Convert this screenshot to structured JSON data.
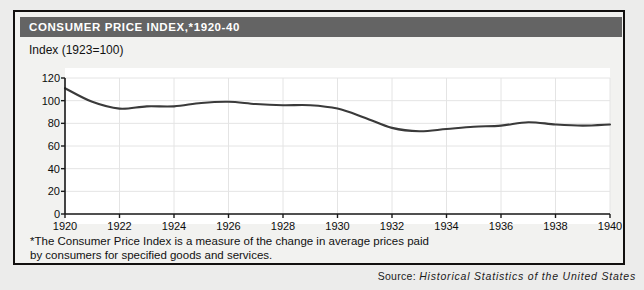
{
  "card": {
    "title": "CONSUMER PRICE INDEX,*1920-40",
    "subtitle": "Index (1923=100)",
    "footnote_line1": "*The Consumer Price Index is a measure of the change in average prices paid",
    "footnote_line2": "by consumers for specified goods and services."
  },
  "source": {
    "label": "Source:",
    "title": "Historical Statistics of the United States"
  },
  "colors": {
    "title_bar": "#646464",
    "title_text": "#ffffff",
    "card_background": "#f2f2f0",
    "page_background": "#ececeb",
    "plot_background": "#ffffff",
    "line": "#3a3a3a",
    "axis": "#1a1a1a",
    "grid": "#e4e4e4"
  },
  "chart_data": {
    "type": "line",
    "title": "CONSUMER PRICE INDEX,*1920-40",
    "subtitle": "Index (1923=100)",
    "xlabel": "",
    "ylabel": "Index (1923=100)",
    "xlim": [
      1920,
      1940
    ],
    "ylim": [
      0,
      120
    ],
    "yticks": [
      0,
      20,
      40,
      60,
      80,
      100,
      120
    ],
    "ytick_labels": [
      "0",
      "20",
      "40",
      "60",
      "80",
      "100",
      "120"
    ],
    "xticks": [
      1920,
      1922,
      1924,
      1926,
      1928,
      1930,
      1932,
      1934,
      1936,
      1938,
      1940
    ],
    "xtick_labels": [
      "1920",
      "1922",
      "1924",
      "1926",
      "1928",
      "1930",
      "1932",
      "1934",
      "1936",
      "1938",
      "1940"
    ],
    "grid": true,
    "legend": false,
    "series": [
      {
        "name": "Consumer Price Index",
        "x": [
          1920,
          1921,
          1922,
          1923,
          1924,
          1925,
          1926,
          1927,
          1928,
          1929,
          1930,
          1931,
          1932,
          1933,
          1934,
          1935,
          1936,
          1937,
          1938,
          1939,
          1940
        ],
        "values": [
          111,
          99,
          93,
          95,
          95,
          98,
          99,
          97,
          96,
          96,
          93,
          85,
          76,
          73,
          75,
          77,
          78,
          81,
          79,
          78,
          79
        ]
      }
    ]
  }
}
